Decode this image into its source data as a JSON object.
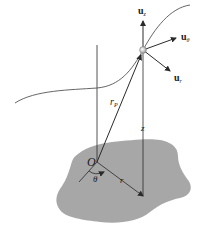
{
  "diagram": {
    "colors": {
      "surface": "#a7a7a7",
      "line": "#2a2a2a",
      "curve": "#555555",
      "particle": "#d8d8d8"
    },
    "labels": {
      "u_z": {
        "main": "u",
        "sub": "z"
      },
      "u_theta": {
        "main": "u",
        "sub": "θ"
      },
      "u_r": {
        "main": "u",
        "sub": "r"
      },
      "r_p": {
        "main": "r",
        "sub": "P"
      },
      "z": "z",
      "origin": "O",
      "theta": "θ",
      "r": "r"
    }
  }
}
